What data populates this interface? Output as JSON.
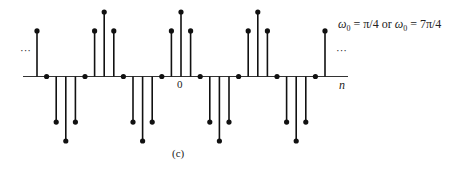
{
  "figure": {
    "caption": "(c)",
    "formula": {
      "w_symbol": "ω",
      "w_sub": "0",
      "part1": " = π/4 or ",
      "part2": " = 7π/4"
    },
    "ellipsis_left": "···",
    "ellipsis_right": "···",
    "axis_label": "n",
    "origin_label": "0"
  },
  "chart_data": {
    "type": "stem",
    "title": "ω0 = π/4 or ω0 = 7π/4",
    "xlabel": "n",
    "ylabel": "",
    "caption": "(c)",
    "x": [
      -15,
      -14,
      -13,
      -12,
      -11,
      -10,
      -9,
      -8,
      -7,
      -6,
      -5,
      -4,
      -3,
      -2,
      -1,
      0,
      1,
      2,
      3,
      4,
      5,
      6,
      7,
      8,
      9,
      10,
      11,
      12,
      13,
      14,
      15
    ],
    "values": [
      0.707,
      0,
      -0.707,
      -1,
      -0.707,
      0,
      0.707,
      1,
      0.707,
      0,
      -0.707,
      -1,
      -0.707,
      0,
      0.707,
      1,
      0.707,
      0,
      -0.707,
      -1,
      -0.707,
      0,
      0.707,
      1,
      0.707,
      0,
      -0.707,
      -1,
      -0.707,
      0,
      0.707
    ],
    "ylim": [
      -1,
      1
    ],
    "grid": false,
    "annotations": [
      "···",
      "···",
      "0"
    ],
    "style": {
      "line_color": "#111111",
      "axis_color": "#333333",
      "origin_px": [
        181,
        76.5
      ],
      "spacing_px": 9.6,
      "unit_height_px": 64.5
    }
  }
}
